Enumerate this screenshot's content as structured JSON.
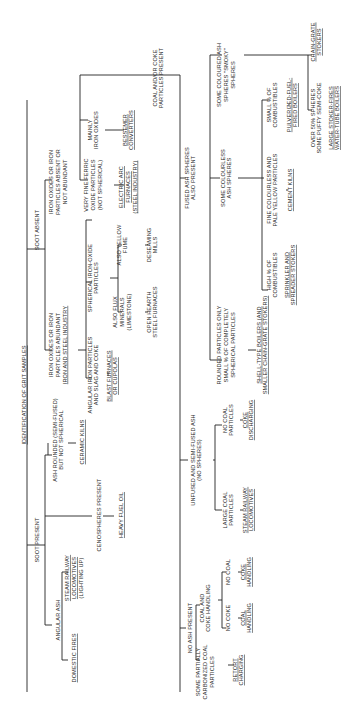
{
  "diagram": {
    "title": "IDENTIFICATION OF GRIT SAMPLES",
    "orientation": "rotated 90deg counter-clockwise",
    "nodes": [
      {
        "id": "root",
        "lines": [
          "IDENTIFICATION OF GRIT SAMPLES"
        ],
        "underline": true,
        "x": 24,
        "y": 395
      },
      {
        "id": "soot_present",
        "lines": [
          "SOOT PRESENT"
        ],
        "x": 37,
        "y": 540
      },
      {
        "id": "soot_absent",
        "lines": [
          "SOOT ABSENT"
        ],
        "x": 37,
        "y": 230
      },
      {
        "id": "angular_ash",
        "lines": [
          "ANGULAR ASH"
        ],
        "x": 58,
        "y": 620
      },
      {
        "id": "domestic_fires",
        "lines": [
          "DOMESTIC FIRES"
        ],
        "underline": true,
        "x": 74,
        "y": 658
      },
      {
        "id": "steam_loco_light",
        "lines": [
          "STEAM RAILWAY",
          "LOCOMOTIVES",
          "(LIGHTING UP)"
        ],
        "underlineLines": [
          0,
          1
        ],
        "x": 74,
        "y": 578
      },
      {
        "id": "cenospheres",
        "lines": [
          "CENOSPHERES PRESENT"
        ],
        "x": 99,
        "y": 515
      },
      {
        "id": "heavy_fuel_oil",
        "lines": [
          "HEAVY FUEL OIL"
        ],
        "underline": true,
        "x": 121,
        "y": 515
      },
      {
        "id": "ash_rounded",
        "lines": [
          "ASH ROUNDED (SEMI-FUSED)",
          "BUT NOT SPHERICAL"
        ],
        "x": 58,
        "y": 440
      },
      {
        "id": "ceramic_kilns",
        "lines": [
          "CERAMIC KILNS"
        ],
        "underline": true,
        "x": 82,
        "y": 442
      },
      {
        "id": "iron_abundant",
        "lines": [
          "IRON OXIDES OR IRON",
          "PARTICLES ABUNDANT",
          "IRON AND STEEL INDUSTRY"
        ],
        "underlineLines": [
          2
        ],
        "x": 58,
        "y": 345
      },
      {
        "id": "angular_iron",
        "lines": [
          "ANGULAR IRON PARTICLES",
          "AND SLAG AND COKE"
        ],
        "x": 93,
        "y": 375
      },
      {
        "id": "blast_furnaces",
        "lines": [
          "BLAST FURNACES",
          "OR CUPOLAS"
        ],
        "underlineLines": [
          0,
          1
        ],
        "x": 112,
        "y": 376
      },
      {
        "id": "spherical_iron",
        "lines": [
          "SPHERICAL IRON-OXIDE",
          "PARTICLES"
        ],
        "x": 93,
        "y": 278
      },
      {
        "id": "also_flux",
        "lines": [
          "ALSO FLUX",
          "MINERALS",
          "(LIMESTONE)"
        ],
        "x": 122,
        "y": 312
      },
      {
        "id": "open_hearth",
        "lines": [
          "OPEN HEARTH",
          "STEEL FURNACES"
        ],
        "x": 152,
        "y": 312
      },
      {
        "id": "also_yellow",
        "lines": [
          "ALSO YELLOW",
          "FUME"
        ],
        "x": 122,
        "y": 245
      },
      {
        "id": "deseaming",
        "lines": [
          "DESEAMING",
          "MILLS"
        ],
        "x": 152,
        "y": 245
      },
      {
        "id": "iron_absent",
        "lines": [
          "IRON OXIDES OR IRON",
          "PARTICLES ABSENT OR",
          "NOT ABUNDANT"
        ],
        "x": 58,
        "y": 182
      },
      {
        "id": "very_fine_ferric",
        "lines": [
          "VERY FINE FERRIC",
          "OXIDE PARTICLES",
          "(NOT SPHERICAL)"
        ],
        "x": 93,
        "y": 185
      },
      {
        "id": "electric_arc",
        "lines": [
          "ELECTRIC ARC",
          "FURNACES",
          "(STEEL INDUSTRY)"
        ],
        "underlineLines": [
          0,
          1,
          2
        ],
        "x": 128,
        "y": 187
      },
      {
        "id": "mainly_iron_oxides",
        "lines": [
          "MAINLY",
          "IRON OXIDES"
        ],
        "x": 93,
        "y": 130
      },
      {
        "id": "bessemer",
        "lines": [
          "BESSEMER",
          "CONVERTERS"
        ],
        "underlineLines": [
          0,
          1
        ],
        "x": 128,
        "y": 130
      },
      {
        "id": "coal_coke_present",
        "lines": [
          "COAL AND/OR COKE",
          "PARTICLES PRESENT"
        ],
        "x": 158,
        "y": 78
      },
      {
        "id": "fused_ash",
        "lines": [
          "FUSED ASH SPHERES",
          "ALSO PRESENT"
        ],
        "x": 190,
        "y": 178
      },
      {
        "id": "some_colourless",
        "lines": [
          "SOME COLOURLESS",
          "ASH SPHERES"
        ],
        "x": 226,
        "y": 178
      },
      {
        "id": "some_coloured",
        "lines": [
          "SOME COLOURED ASH",
          "SPHERES \"SMOKY\"",
          "SPHERES"
        ],
        "x": 226,
        "y": 75
      },
      {
        "id": "high_combustibles",
        "lines": [
          "HIGH % OF",
          "COMBUSTIBLES"
        ],
        "x": 272,
        "y": 275
      },
      {
        "id": "sprinkler",
        "lines": [
          "SPRINKLER AND",
          "SPREADER STOKERS"
        ],
        "underlineLines": [
          0,
          1
        ],
        "x": 290,
        "y": 275
      },
      {
        "id": "fine_colourless",
        "lines": [
          "FINE COLOURLESS AND",
          "PALE YELLOW PARTICLES"
        ],
        "x": 272,
        "y": 190
      },
      {
        "id": "cement_kilns",
        "lines": [
          "CEMENT KILNS"
        ],
        "underline": true,
        "x": 290,
        "y": 190
      },
      {
        "id": "small_combustibles",
        "lines": [
          "SMALL % OF",
          "COMBUSTIBLES"
        ],
        "x": 272,
        "y": 105
      },
      {
        "id": "pulverized",
        "lines": [
          "PULVERIZED-FUEL-",
          "FIRED BOILERS"
        ],
        "underlineLines": [
          0,
          1
        ],
        "x": 292,
        "y": 105
      },
      {
        "id": "chain_grate",
        "lines": [
          "CHAIN-GRATE",
          "STOKERS"
        ],
        "underlineLines": [
          0,
          1
        ],
        "x": 316,
        "y": 42
      },
      {
        "id": "over_50",
        "lines": [
          "OVER 50% SPHERES",
          "SOME PUFFY SEMI-COKE"
        ],
        "x": 316,
        "y": 118
      },
      {
        "id": "large_stoker",
        "lines": [
          "LARGE STOKER-FIRES",
          "WATER-TUBE BOILERS"
        ],
        "underlineLines": [
          0,
          1
        ],
        "x": 334,
        "y": 118
      },
      {
        "id": "rounded_only",
        "lines": [
          "ROUNDED PARTICLES ONLY",
          "SMALL % OF COMPLETELY",
          "SPHERICAL PARTICLES"
        ],
        "x": 226,
        "y": 345
      },
      {
        "id": "shell_type",
        "lines": [
          "SHELL-TYPE BOILERS (AND",
          "SMALLER CHAIN-GRATE STOKERS)"
        ],
        "underlineLines": [
          0,
          1
        ],
        "x": 262,
        "y": 345
      },
      {
        "id": "unfused",
        "lines": [
          "UNFUSED AND SEMI-FUSED ASH",
          "(NO SPHERES)"
        ],
        "x": 196,
        "y": 460
      },
      {
        "id": "large_coal",
        "lines": [
          "LARGE COAL",
          "PARTICLES"
        ],
        "x": 228,
        "y": 510
      },
      {
        "id": "steam_loco",
        "lines": [
          "STEAM RAILWAY",
          "LOCOMOTIVES"
        ],
        "underlineLines": [
          0,
          1
        ],
        "x": 248,
        "y": 510
      },
      {
        "id": "no_coal_particles",
        "lines": [
          "NO COAL",
          "PARTICLES"
        ],
        "x": 228,
        "y": 420
      },
      {
        "id": "coke_discharging",
        "lines": [
          "COKE",
          "DISCHARGING"
        ],
        "underlineLines": [
          0,
          1
        ],
        "x": 248,
        "y": 420
      },
      {
        "id": "no_ash",
        "lines": [
          "NO ASH PRESENT"
        ],
        "x": 190,
        "y": 628
      },
      {
        "id": "some_partially",
        "lines": [
          "SOME PARTIALLY",
          "CARBONIZED COAL",
          "PARTICLES"
        ],
        "x": 205,
        "y": 672
      },
      {
        "id": "retort",
        "lines": [
          "RETORT",
          "CHARGING"
        ],
        "underlineLines": [
          0,
          1
        ],
        "x": 238,
        "y": 670
      },
      {
        "id": "coal_and_coke",
        "lines": [
          "COAL AND",
          "COKE HANDLING"
        ],
        "x": 205,
        "y": 608
      },
      {
        "id": "no_coke",
        "lines": [
          "NO COKE"
        ],
        "x": 228,
        "y": 618
      },
      {
        "id": "coal_handling",
        "lines": [
          "COAL",
          "HANDLING"
        ],
        "underlineLines": [
          0,
          1
        ],
        "x": 246,
        "y": 618
      },
      {
        "id": "no_coal",
        "lines": [
          "NO COAL"
        ],
        "x": 228,
        "y": 572
      },
      {
        "id": "coke_handling",
        "lines": [
          "COKE",
          "HANDLING"
        ],
        "underlineLines": [
          0,
          1
        ],
        "x": 246,
        "y": 572
      }
    ]
  }
}
